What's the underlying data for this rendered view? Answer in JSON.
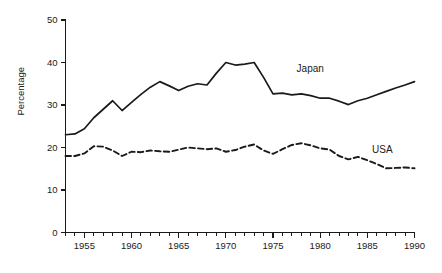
{
  "chart_data": {
    "type": "line",
    "title": "",
    "xlabel": "",
    "ylabel": "Percentage",
    "xlim": [
      1953,
      1990
    ],
    "ylim": [
      0,
      50
    ],
    "grid": false,
    "legend_position": "inline-right",
    "y_ticks": [
      0,
      10,
      20,
      30,
      40,
      50
    ],
    "y_tick_labels": [
      "0",
      "10",
      "20",
      "30",
      "40",
      "50"
    ],
    "x_ticks": [
      1955,
      1960,
      1965,
      1970,
      1975,
      1980,
      1985,
      1990
    ],
    "x_tick_labels": [
      "1955",
      "1960",
      "1965",
      "1970",
      "1975",
      "1980",
      "1985",
      "1990"
    ],
    "x_minor_step": 1,
    "x": [
      1953,
      1954,
      1955,
      1956,
      1957,
      1958,
      1959,
      1960,
      1961,
      1962,
      1963,
      1964,
      1965,
      1966,
      1967,
      1968,
      1969,
      1970,
      1971,
      1972,
      1973,
      1974,
      1975,
      1976,
      1977,
      1978,
      1979,
      1980,
      1981,
      1982,
      1983,
      1984,
      1985,
      1986,
      1987,
      1988,
      1989,
      1990
    ],
    "series": [
      {
        "name": "Japan",
        "style": "solid",
        "color": "#1a1a1a",
        "label_x": 1977.5,
        "label_y": 37.7,
        "values": [
          23.0,
          23.2,
          24.4,
          27.0,
          29.0,
          31.0,
          28.7,
          30.6,
          32.5,
          34.2,
          35.5,
          34.5,
          33.4,
          34.4,
          35.0,
          34.7,
          37.5,
          40.0,
          39.4,
          39.6,
          40.0,
          36.5,
          32.6,
          32.8,
          32.4,
          32.6,
          32.2,
          31.6,
          31.6,
          30.9,
          30.1,
          31.0,
          31.6,
          32.4,
          33.2,
          34.0,
          34.7,
          35.5
        ]
      },
      {
        "name": "USA",
        "style": "dashed",
        "color": "#1a1a1a",
        "label_x": 1985.5,
        "label_y": 18.6,
        "values": [
          18.0,
          18.0,
          18.6,
          20.3,
          20.2,
          19.3,
          18.0,
          19.0,
          18.9,
          19.3,
          19.1,
          19.0,
          19.5,
          20.0,
          19.8,
          19.6,
          19.8,
          19.0,
          19.4,
          20.2,
          20.7,
          19.3,
          18.5,
          19.6,
          20.6,
          21.0,
          20.5,
          19.8,
          19.5,
          18.0,
          17.2,
          17.8,
          17.0,
          16.1,
          15.1,
          15.2,
          15.3,
          15.1
        ]
      }
    ]
  }
}
